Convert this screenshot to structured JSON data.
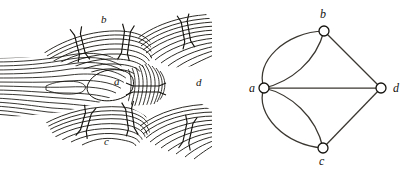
{
  "figure": {
    "caption": "",
    "background_color": "#ffffff",
    "ink_color": "#15130f",
    "line_color": "#3a3630"
  },
  "map_panel": {
    "name": "konigsberg-river-map",
    "description": "Engraved map of the river Pregel with four land masses and seven bridges",
    "land_labels": [
      {
        "id": "b",
        "text": "b",
        "x": 101,
        "y": 14
      },
      {
        "id": "a",
        "text": "a",
        "x": 114,
        "y": 76
      },
      {
        "id": "d",
        "text": "d",
        "x": 196,
        "y": 77
      },
      {
        "id": "c",
        "text": "c",
        "x": 104,
        "y": 136
      }
    ],
    "bridge_count": 7,
    "bridges": [
      {
        "id": "bridge-1",
        "connects": "a-b",
        "x": 77,
        "y": 45,
        "angle": -14
      },
      {
        "id": "bridge-2",
        "connects": "a-b",
        "x": 122,
        "y": 40,
        "angle": 10
      },
      {
        "id": "bridge-3",
        "connects": "a-c",
        "x": 84,
        "y": 120,
        "angle": 16
      },
      {
        "id": "bridge-4",
        "connects": "a-c",
        "x": 126,
        "y": 118,
        "angle": -8
      },
      {
        "id": "bridge-5",
        "connects": "a-d",
        "x": 144,
        "y": 86,
        "angle": 90
      },
      {
        "id": "bridge-6",
        "connects": "b-d",
        "x": 182,
        "y": 33,
        "angle": -10
      },
      {
        "id": "bridge-7",
        "connects": "c-d",
        "x": 184,
        "y": 133,
        "angle": 12
      }
    ]
  },
  "graph_panel": {
    "name": "konigsberg-multigraph",
    "description": "Multigraph abstraction: four vertices a,b,c,d with seven edges",
    "node_radius": 5,
    "nodes": [
      {
        "id": "a",
        "label": "a",
        "x": 52,
        "y": 88,
        "label_x": 37,
        "label_y": 82
      },
      {
        "id": "b",
        "label": "b",
        "x": 112,
        "y": 31,
        "label_x": 108,
        "label_y": 8
      },
      {
        "id": "c",
        "label": "c",
        "x": 111,
        "y": 148,
        "label_x": 107,
        "label_y": 155
      },
      {
        "id": "d",
        "label": "d",
        "x": 169,
        "y": 88,
        "label_x": 181,
        "label_y": 82
      }
    ],
    "edges": [
      {
        "id": "edge-ab-1",
        "from": "a",
        "to": "b",
        "kind": "curve",
        "curvature": -22
      },
      {
        "id": "edge-ab-2",
        "from": "a",
        "to": "b",
        "kind": "curve",
        "curvature": 20
      },
      {
        "id": "edge-ac-1",
        "from": "a",
        "to": "c",
        "kind": "curve",
        "curvature": 22
      },
      {
        "id": "edge-ac-2",
        "from": "a",
        "to": "c",
        "kind": "curve",
        "curvature": -20
      },
      {
        "id": "edge-ad",
        "from": "a",
        "to": "d",
        "kind": "line",
        "curvature": 0
      },
      {
        "id": "edge-bd",
        "from": "b",
        "to": "d",
        "kind": "line",
        "curvature": 0
      },
      {
        "id": "edge-cd",
        "from": "c",
        "to": "d",
        "kind": "line",
        "curvature": 0
      }
    ],
    "edge_count": 7
  }
}
